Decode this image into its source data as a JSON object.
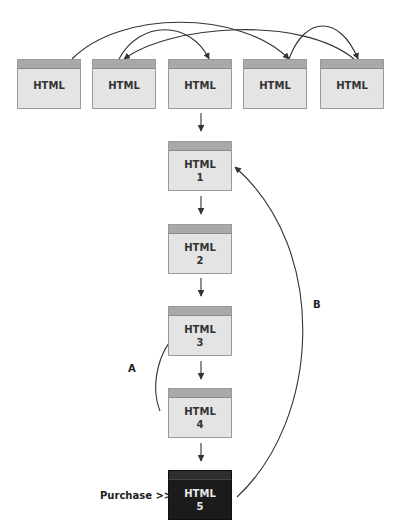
{
  "top_row": [
    {
      "label": "HTML"
    },
    {
      "label": "HTML"
    },
    {
      "label": "HTML"
    },
    {
      "label": "HTML"
    },
    {
      "label": "HTML"
    }
  ],
  "funnel": [
    {
      "label": "HTML",
      "number": "1"
    },
    {
      "label": "HTML",
      "number": "2"
    },
    {
      "label": "HTML",
      "number": "3"
    },
    {
      "label": "HTML",
      "number": "4"
    },
    {
      "label": "HTML",
      "number": "5",
      "highlight": true
    }
  ],
  "annotations": {
    "arrow_a": "A",
    "arrow_b": "B",
    "purchase": "Purchase >>"
  },
  "colors": {
    "box_fill": "#e4e4e4",
    "box_bar": "#a9a9a9",
    "final_box": "#1b1b1b",
    "line": "#333333"
  }
}
